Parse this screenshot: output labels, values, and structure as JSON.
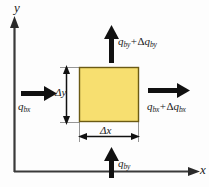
{
  "figure": {
    "kind": "control-volume-flux-balance-diagram",
    "background_color": "#fdfdfd"
  },
  "axes": {
    "y_label": "y",
    "x_label": "x",
    "line_color": "#3a3a3a",
    "origin": {
      "x": 14,
      "y": 172
    }
  },
  "element": {
    "name": "control-volume",
    "fill_color": "#F7DF70",
    "border_color": "#6b5a14",
    "x": 79,
    "y": 67,
    "width": 60,
    "height": 55
  },
  "dimensions": {
    "width_label": "Δx",
    "height_label": "Δy",
    "arrow_color": "#111111"
  },
  "fluxes": {
    "left": {
      "symbol": "q",
      "subscript": "bx",
      "label": "q bx",
      "direction": "right"
    },
    "right": {
      "symbol": "q",
      "subscript": "bx",
      "operator": "+",
      "delta": "Δ",
      "label": "q bx + Δ q bx",
      "direction": "right"
    },
    "bottom": {
      "symbol": "q",
      "subscript": "by",
      "label": "q by",
      "direction": "up"
    },
    "top": {
      "symbol": "q",
      "subscript": "by",
      "operator": "+",
      "delta": "Δ",
      "label": "q by + Δ q by",
      "direction": "up"
    },
    "arrow_color": "#111111"
  }
}
